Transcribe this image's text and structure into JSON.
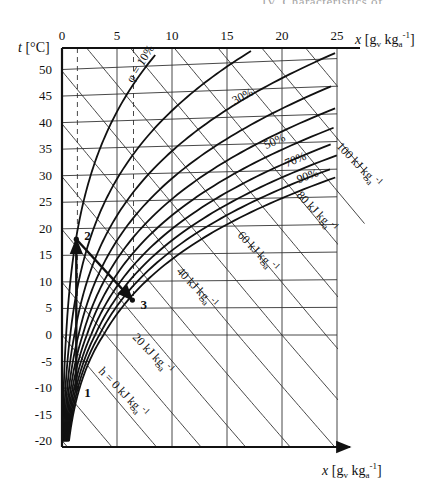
{
  "header": {
    "running_title": "IV. Characteristics of ..."
  },
  "chart_data": {
    "type": "line",
    "xlabel": "x [g_v kg_a^-1]",
    "ylabel": "t [°C]",
    "xlim": [
      0,
      25
    ],
    "ylim": [
      -20,
      50
    ],
    "x_ticks": [
      0,
      5,
      10,
      15,
      20,
      25
    ],
    "y_ticks": [
      50,
      45,
      40,
      35,
      30,
      25,
      20,
      15,
      10,
      5,
      0,
      -5,
      -10,
      -15,
      -20
    ],
    "grid": true,
    "relative_humidity_curves_percent": [
      10,
      20,
      30,
      40,
      50,
      60,
      70,
      80,
      90,
      100
    ],
    "relative_humidity_labels": [
      {
        "text": "φ = 10%",
        "phi": 10
      },
      {
        "text": "30%",
        "phi": 30
      },
      {
        "text": "50%",
        "phi": 50
      },
      {
        "text": "70%",
        "phi": 70
      },
      {
        "text": "90%",
        "phi": 90
      }
    ],
    "enthalpy_lines_kJ_per_kg": [
      -20,
      -10,
      0,
      10,
      20,
      30,
      40,
      50,
      60,
      70,
      80,
      90,
      100,
      110,
      120,
      130,
      140
    ],
    "enthalpy_labels": [
      {
        "text": "h = 0 kJ kg",
        "sup": "-1",
        "h": 0
      },
      {
        "text": "20 kJ kg",
        "sup": "-1",
        "h": 20
      },
      {
        "text": "40 kJ kg",
        "sup": "-1",
        "h": 40
      },
      {
        "text": "60 kJ kg",
        "sup": "-1",
        "h": 60
      },
      {
        "text": "80 kJ kg",
        "sup": "-1",
        "h": 80
      },
      {
        "text": "100 kJ kg",
        "sup": "-1",
        "h": 100
      }
    ],
    "dashed_vertical_lines_x": [
      1.4,
      6.5
    ],
    "process_points": [
      {
        "label": "1",
        "x": 1.3,
        "t": -10
      },
      {
        "label": "2",
        "x": 1.3,
        "t": 18
      },
      {
        "label": "3",
        "x": 6.4,
        "t": 6.5
      }
    ],
    "process_arrows": [
      {
        "from": "1",
        "to": "2"
      },
      {
        "from": "2",
        "to": "3"
      }
    ]
  },
  "axes": {
    "top_x_title": "x [gv kga-1]",
    "bottom_x_title": "x [gv kga-1]",
    "y_title": "t [°C]",
    "x_var": "x",
    "x_unit_g": "g",
    "x_unit_v": "v",
    "x_unit_kg": "kg",
    "x_unit_a": "a",
    "x_unit_exp": "-1",
    "y_var": "t",
    "y_unit": "[°C]"
  }
}
